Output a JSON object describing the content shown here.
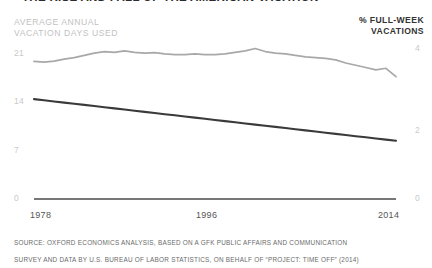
{
  "header": {
    "title": "THE RISE AND FALL OF THE AMERICAN VACATION",
    "left_caption": "AVERAGE ANNUAL\nVACATION DAYS USED",
    "right_caption": "% FULL-WEEK\nVACATIONS"
  },
  "source": {
    "line1": "SOURCE: OXFORD ECONOMICS ANALYSIS, BASED ON A GFK PUBLIC AFFAIRS AND COMMUNICATION",
    "line2": "SURVEY AND DATA BY U.S. BUREAU OF LABOR STATISTICS, ON BEHALF OF “PROJECT: TIME OFF” (2014)"
  },
  "colors": {
    "vacation_days_line": "#3a3a3a",
    "full_week_line": "#a8a8a8",
    "axis": "#4a4a4a",
    "tick_label": "#c9c9c9",
    "xtick_label": "#555555",
    "left_caption": "#c2c2c2",
    "right_caption": "#333333"
  },
  "chart_data": {
    "type": "line",
    "title": "THE RISE AND FALL OF THE AMERICAN VACATION",
    "xlabel": "",
    "grid": false,
    "legend": "axis-labels",
    "x": [
      1978,
      1979,
      1980,
      1981,
      1982,
      1983,
      1984,
      1985,
      1986,
      1987,
      1988,
      1989,
      1990,
      1991,
      1992,
      1993,
      1994,
      1995,
      1996,
      1997,
      1998,
      1999,
      2000,
      2001,
      2002,
      2003,
      2004,
      2005,
      2006,
      2007,
      2008,
      2009,
      2010,
      2011,
      2012,
      2013,
      2014
    ],
    "xticks": [
      1978,
      1996,
      2014
    ],
    "xlim": [
      1978,
      2014
    ],
    "axes": [
      {
        "name": "left",
        "label": "AVERAGE ANNUAL VACATION DAYS USED",
        "ticks": [
          0,
          7,
          14,
          21
        ],
        "ylim": [
          0,
          22.5
        ]
      },
      {
        "name": "right",
        "label": "% FULL-WEEK VACATIONS",
        "ticks": [
          0,
          2,
          4
        ],
        "ylim": [
          0,
          4.3
        ]
      }
    ],
    "series": [
      {
        "name": "% FULL-WEEK VACATIONS",
        "axis": "right",
        "color": "#a8a8a8",
        "style": "jagged-line",
        "values": [
          3.62,
          3.6,
          3.63,
          3.68,
          3.72,
          3.78,
          3.84,
          3.88,
          3.86,
          3.9,
          3.86,
          3.84,
          3.85,
          3.82,
          3.8,
          3.8,
          3.82,
          3.8,
          3.8,
          3.82,
          3.86,
          3.9,
          3.96,
          3.88,
          3.84,
          3.82,
          3.78,
          3.74,
          3.72,
          3.7,
          3.66,
          3.58,
          3.52,
          3.46,
          3.4,
          3.44,
          3.22
        ]
      },
      {
        "name": "AVERAGE ANNUAL VACATION DAYS USED",
        "axis": "left",
        "color": "#3a3a3a",
        "style": "straight-line",
        "values": [
          13.8,
          13.64,
          13.48,
          13.32,
          13.16,
          13.0,
          12.84,
          12.68,
          12.52,
          12.36,
          12.2,
          12.04,
          11.88,
          11.72,
          11.56,
          11.4,
          11.24,
          11.08,
          10.92,
          10.76,
          10.6,
          10.44,
          10.28,
          10.12,
          9.96,
          9.8,
          9.64,
          9.48,
          9.32,
          9.16,
          9.0,
          8.84,
          8.68,
          8.52,
          8.36,
          8.2,
          8.05
        ]
      }
    ]
  }
}
